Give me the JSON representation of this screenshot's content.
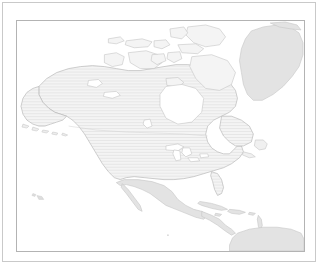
{
  "page": {
    "background_color": "#ffffff",
    "outer_border_color": "#c9c9c9"
  },
  "map": {
    "title": "",
    "frame_border_color": "#b3b3b3",
    "ocean_color": "#ffffff",
    "highlight_fill_color": "#f2f2f2",
    "highlight_stripe_color": "#e4e4e4",
    "context_fill_color": "#e3e3e3",
    "coastline_color": "#b9b9b9",
    "border_color": "#c6c6c6",
    "projection": "equirectangular",
    "regions": [
      {
        "name": "united-states",
        "label": "United States",
        "style": "highlight",
        "fill": "#f2f2f2"
      },
      {
        "name": "canada",
        "label": "Canada",
        "style": "highlight",
        "fill": "#f2f2f2"
      },
      {
        "name": "alaska",
        "label": "Alaska",
        "style": "highlight",
        "fill": "#f2f2f2"
      },
      {
        "name": "greenland",
        "label": "Greenland",
        "style": "context",
        "fill": "#e3e3e3"
      },
      {
        "name": "mexico",
        "label": "Mexico",
        "style": "context",
        "fill": "#e3e3e3"
      },
      {
        "name": "central-america",
        "label": "Central America",
        "style": "context",
        "fill": "#e3e3e3"
      },
      {
        "name": "caribbean",
        "label": "Caribbean Islands",
        "style": "context",
        "fill": "#e3e3e3"
      },
      {
        "name": "south-america",
        "label": "South America",
        "style": "context",
        "fill": "#e3e3e3"
      }
    ],
    "water_bodies": [
      {
        "name": "hudson-bay",
        "label": "Hudson Bay"
      },
      {
        "name": "great-lakes",
        "label": "Great Lakes"
      },
      {
        "name": "gulf-of-mexico",
        "label": "Gulf of Mexico"
      }
    ]
  }
}
